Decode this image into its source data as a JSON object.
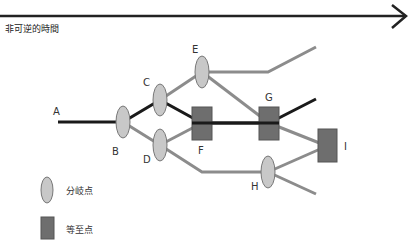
{
  "time_axis": {
    "label": "非可逆的時間",
    "color": "#222222"
  },
  "nodes": {
    "A": {
      "label": "A",
      "type": "start"
    },
    "B": {
      "label": "B",
      "type": "branch"
    },
    "C": {
      "label": "C",
      "type": "branch"
    },
    "D": {
      "label": "D",
      "type": "branch"
    },
    "E": {
      "label": "E",
      "type": "branch"
    },
    "F": {
      "label": "F",
      "type": "convergence"
    },
    "G": {
      "label": "G",
      "type": "convergence"
    },
    "H": {
      "label": "H",
      "type": "branch"
    },
    "I": {
      "label": "I",
      "type": "convergence"
    }
  },
  "edges": [
    {
      "from": "A",
      "to": "B",
      "style": "main"
    },
    {
      "from": "B",
      "to": "C",
      "style": "main"
    },
    {
      "from": "C",
      "to": "F",
      "style": "main"
    },
    {
      "from": "F",
      "to": "G",
      "style": "main"
    },
    {
      "from": "G",
      "to": "end-upper-mid",
      "style": "main"
    },
    {
      "from": "B",
      "to": "D",
      "style": "alt"
    },
    {
      "from": "D",
      "to": "F",
      "style": "alt"
    },
    {
      "from": "D",
      "to": "H",
      "style": "alt"
    },
    {
      "from": "C",
      "to": "E",
      "style": "alt"
    },
    {
      "from": "E",
      "to": "end-top",
      "style": "alt"
    },
    {
      "from": "E",
      "to": "G",
      "style": "alt"
    },
    {
      "from": "G",
      "to": "I",
      "style": "alt"
    },
    {
      "from": "H",
      "to": "I",
      "style": "alt"
    },
    {
      "from": "H",
      "to": "end-bottom",
      "style": "alt"
    }
  ],
  "legend": {
    "branch_label": "分岐点",
    "convergence_label": "等至点"
  },
  "colors": {
    "main_path": "#1a1a1a",
    "alt_path": "#8c8c8c",
    "branch_fill": "#c8c8c8",
    "convergence_fill": "#6e6e6e"
  }
}
